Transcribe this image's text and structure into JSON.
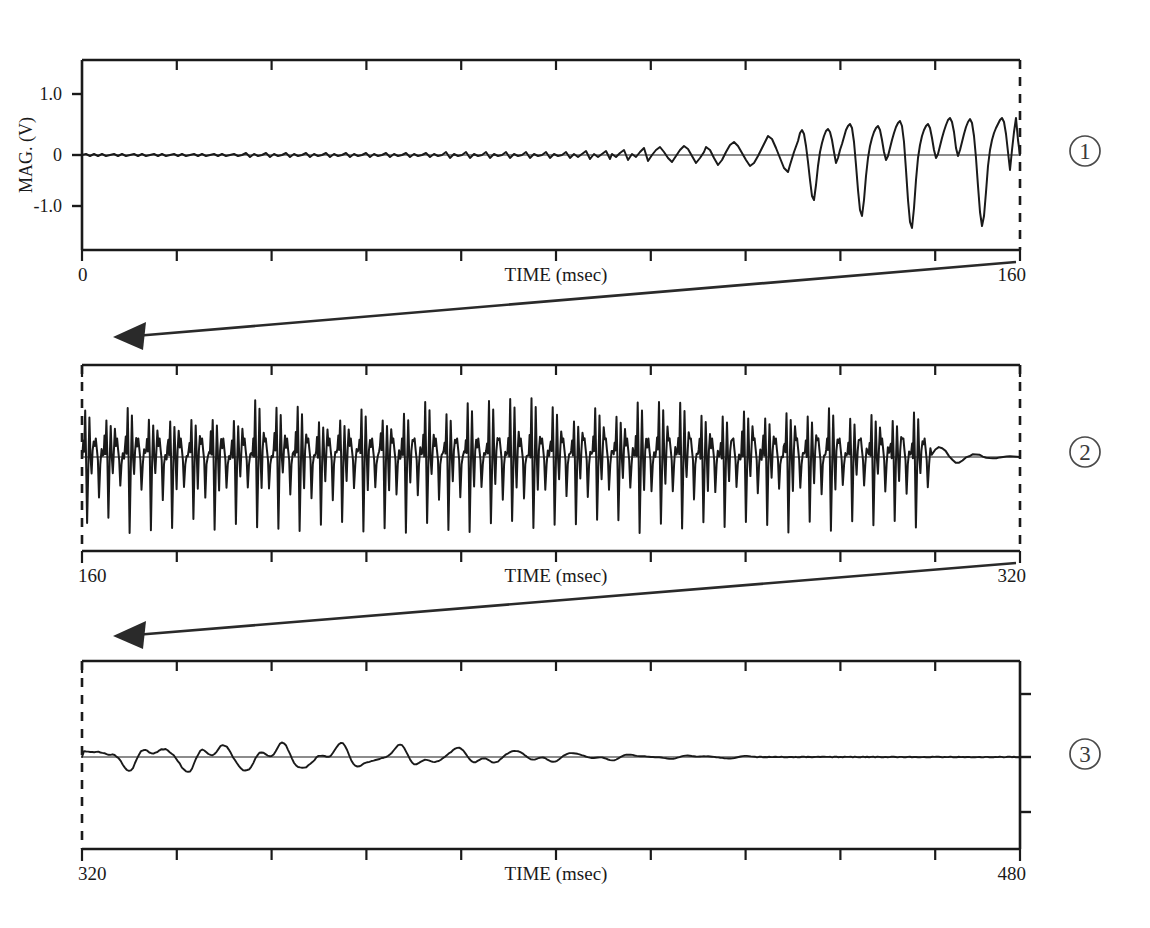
{
  "figure": {
    "y_axis_title": "MAG. (V)",
    "x_axis_title": "TIME (msec)",
    "y_ticks": [
      "1.0",
      "0",
      "-1.0"
    ],
    "panel_marks": [
      "1",
      "2",
      "3"
    ]
  },
  "panels": [
    {
      "id": "panel-1",
      "number": "1",
      "x_start_label": "0",
      "x_end_label": "160",
      "x_title": "TIME (msec)",
      "y_title": "MAG. (V)",
      "y_tick_labels": [
        "1.0",
        "0",
        "-1.0"
      ]
    },
    {
      "id": "panel-2",
      "number": "2",
      "x_start_label": "160",
      "x_end_label": "320",
      "x_title": "TIME (msec)",
      "y_tick_labels": []
    },
    {
      "id": "panel-3",
      "number": "3",
      "x_start_label": "320",
      "x_end_label": "480",
      "x_title": "TIME (msec)",
      "y_tick_labels": []
    }
  ],
  "chart_data": {
    "type": "line",
    "title": "",
    "xlabel": "TIME (msec)",
    "ylabel": "MAG. (V)",
    "ylim": [
      -1.6,
      1.6
    ],
    "y_ticks": [
      1.0,
      0,
      -1.0
    ],
    "grid": false,
    "legend": "none",
    "panels": [
      {
        "name": "1",
        "xlim": [
          0,
          160
        ],
        "x_tick_interval": 16,
        "x_ticks": [
          0,
          16,
          32,
          48,
          64,
          80,
          96,
          112,
          128,
          144,
          160
        ],
        "series": [
          {
            "name": "MAG. (V) segment 1",
            "x": [
              0,
              2,
              4,
              6,
              8,
              10,
              12,
              14,
              16,
              18,
              20,
              22,
              24,
              26,
              28,
              30,
              32,
              34,
              36,
              38,
              40,
              42,
              44,
              46,
              48,
              50,
              52,
              54,
              56,
              58,
              60,
              62,
              64,
              66,
              68,
              70,
              72,
              74,
              76,
              78,
              80,
              82,
              84,
              86,
              88,
              90,
              92,
              94,
              96,
              98,
              100,
              102,
              104,
              105,
              106,
              107,
              108,
              109,
              110,
              111,
              112,
              113,
              114,
              115,
              116,
              117,
              118,
              119,
              120,
              121,
              122,
              123,
              124,
              125,
              126,
              127,
              128,
              129,
              130,
              131,
              132,
              133,
              134,
              135,
              136,
              137,
              138,
              139,
              140,
              141,
              142,
              143,
              144,
              145,
              146,
              147,
              148,
              149,
              150,
              151,
              152,
              153,
              154,
              155,
              156,
              157,
              158,
              159,
              160
            ],
            "y": [
              0.0,
              0.02,
              -0.02,
              0.03,
              -0.01,
              0.02,
              -0.03,
              0.01,
              0.02,
              -0.02,
              0.03,
              0.0,
              -0.02,
              0.02,
              0.01,
              -0.03,
              0.02,
              0.0,
              0.03,
              -0.02,
              0.01,
              0.02,
              -0.01,
              0.03,
              -0.02,
              0.02,
              0.0,
              -0.03,
              0.02,
              0.01,
              -0.02,
              0.03,
              0.0,
              0.02,
              -0.02,
              0.04,
              0.01,
              -0.03,
              0.02,
              0.0,
              0.03,
              -0.02,
              0.05,
              0.02,
              -0.03,
              0.04,
              0.01,
              -0.02,
              0.06,
              0.03,
              -0.04,
              0.08,
              0.05,
              0.12,
              0.02,
              -0.14,
              0.04,
              0.1,
              -0.06,
              0.05,
              0.14,
              0.06,
              -0.1,
              0.08,
              0.18,
              0.1,
              -0.08,
              0.22,
              0.3,
              0.26,
              0.12,
              -0.3,
              -0.55,
              -0.2,
              0.18,
              0.34,
              0.38,
              0.3,
              0.05,
              -0.4,
              -0.78,
              -0.3,
              0.15,
              0.36,
              0.28,
              0.1,
              -0.45,
              -0.88,
              -0.35,
              0.2,
              0.42,
              0.33,
              0.48,
              0.24,
              -0.2,
              -0.72,
              -0.95,
              -0.25,
              0.45,
              0.58,
              0.3,
              0.52,
              0.2,
              -0.55,
              -1.05,
              -0.35,
              0.55,
              0.62,
              0.05
            ]
          }
        ]
      },
      {
        "name": "2",
        "xlim": [
          160,
          320
        ],
        "x_tick_interval": 16,
        "x_ticks": [
          160,
          176,
          192,
          208,
          224,
          240,
          256,
          272,
          288,
          304,
          320
        ],
        "series": [
          {
            "name": "MAG. (V) segment 2",
            "burst_period_ms": 3.9,
            "burst_count": 40,
            "burst_onset_ms": 160,
            "burst_offset_ms": 305,
            "peak_positive": 0.95,
            "peak_negative": -1.25,
            "note": "Repeating spike complex: sharp positive spike to ~+0.9, immediate deep negative excursion to ~-1.2, followed by a smaller damped positive shoulder near +0.35 before the next cycle."
          }
        ]
      },
      {
        "name": "3",
        "xlim": [
          320,
          480
        ],
        "x_tick_interval": 16,
        "x_ticks": [
          320,
          336,
          352,
          368,
          384,
          400,
          416,
          432,
          448,
          464,
          480
        ],
        "y_tick_side": "right",
        "series": [
          {
            "name": "MAG. (V) segment 3",
            "oscillation_period_ms": 6.0,
            "initial_amplitude": 0.3,
            "final_amplitude": 0.01,
            "decay_end_ms": 435,
            "note": "Low-amplitude damped oscillatory afterdischarge; biphasic wavelets decaying smoothly to flat baseline."
          }
        ]
      }
    ]
  }
}
